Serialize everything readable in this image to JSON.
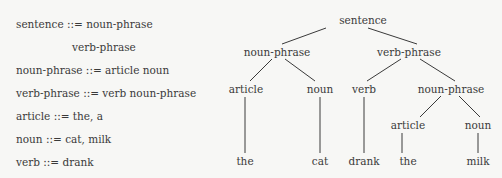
{
  "grammar": {
    "rules": [
      {
        "text": "sentence ::= noun-phrase",
        "x": 16,
        "y": 24
      },
      {
        "text": "verb-phrase",
        "x": 72,
        "y": 47
      },
      {
        "text": "noun-phrase ::= article noun",
        "x": 16,
        "y": 70
      },
      {
        "text": "verb-phrase ::= verb noun-phrase",
        "x": 16,
        "y": 93
      },
      {
        "text": "article ::= the, a",
        "x": 16,
        "y": 116
      },
      {
        "text": "noun ::= cat, milk",
        "x": 16,
        "y": 139
      },
      {
        "text": "verb ::= drank",
        "x": 16,
        "y": 162
      }
    ]
  },
  "tree": {
    "nodes": [
      {
        "id": "n0",
        "label": "sentence",
        "x": 363,
        "y": 20
      },
      {
        "id": "n1",
        "label": "noun-phrase",
        "x": 277,
        "y": 52
      },
      {
        "id": "n2",
        "label": "verb-phrase",
        "x": 409,
        "y": 52
      },
      {
        "id": "n3",
        "label": "article",
        "x": 246,
        "y": 89
      },
      {
        "id": "n4",
        "label": "noun",
        "x": 320,
        "y": 89
      },
      {
        "id": "n5",
        "label": "verb",
        "x": 364,
        "y": 89
      },
      {
        "id": "n6",
        "label": "noun-phrase",
        "x": 451,
        "y": 89
      },
      {
        "id": "n7",
        "label": "article",
        "x": 408,
        "y": 125
      },
      {
        "id": "n8",
        "label": "noun",
        "x": 478,
        "y": 125
      },
      {
        "id": "n9",
        "label": "the",
        "x": 245,
        "y": 161
      },
      {
        "id": "n10",
        "label": "cat",
        "x": 320,
        "y": 161
      },
      {
        "id": "n11",
        "label": "drank",
        "x": 364,
        "y": 161
      },
      {
        "id": "n12",
        "label": "the",
        "x": 408,
        "y": 161
      },
      {
        "id": "n13",
        "label": "milk",
        "x": 478,
        "y": 161
      }
    ],
    "edges": [
      {
        "x1": 326,
        "y1": 28,
        "x2": 282,
        "y2": 44
      },
      {
        "x1": 368,
        "y1": 28,
        "x2": 417,
        "y2": 44
      },
      {
        "x1": 272,
        "y1": 59,
        "x2": 250,
        "y2": 81
      },
      {
        "x1": 285,
        "y1": 59,
        "x2": 315,
        "y2": 81
      },
      {
        "x1": 401,
        "y1": 59,
        "x2": 367,
        "y2": 81
      },
      {
        "x1": 420,
        "y1": 59,
        "x2": 455,
        "y2": 81
      },
      {
        "x1": 245,
        "y1": 97,
        "x2": 245,
        "y2": 153
      },
      {
        "x1": 320,
        "y1": 97,
        "x2": 320,
        "y2": 153
      },
      {
        "x1": 364,
        "y1": 97,
        "x2": 364,
        "y2": 153
      },
      {
        "x1": 441,
        "y1": 96,
        "x2": 420,
        "y2": 117
      },
      {
        "x1": 459,
        "y1": 96,
        "x2": 480,
        "y2": 117
      },
      {
        "x1": 402,
        "y1": 133,
        "x2": 402,
        "y2": 153
      },
      {
        "x1": 478,
        "y1": 133,
        "x2": 478,
        "y2": 153
      }
    ],
    "line_color": "#3a3a3a"
  }
}
